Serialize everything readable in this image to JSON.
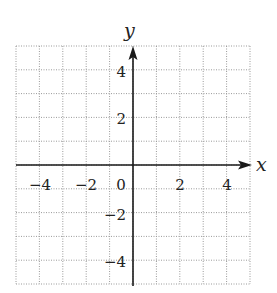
{
  "chart_data": {
    "type": "scatter",
    "title": "",
    "xlabel": "x",
    "ylabel": "y",
    "xlim": [
      -5,
      5
    ],
    "ylim": [
      -5,
      5
    ],
    "grid": true,
    "grid_style": "dotted",
    "grid_step": 1,
    "x_ticks": [
      {
        "value": -4,
        "label": "−4"
      },
      {
        "value": -2,
        "label": "−2"
      },
      {
        "value": 0,
        "label": "0"
      },
      {
        "value": 2,
        "label": "2"
      },
      {
        "value": 4,
        "label": "4"
      }
    ],
    "y_ticks": [
      {
        "value": 4,
        "label": "4"
      },
      {
        "value": 2,
        "label": "2"
      },
      {
        "value": -2,
        "label": "−2"
      },
      {
        "value": -4,
        "label": "−4"
      }
    ],
    "series": [],
    "legend": null,
    "axis_arrows": {
      "x_positive": true,
      "y_positive": true
    }
  },
  "labels": {
    "x_axis": "x",
    "y_axis": "y",
    "x_ticks": [
      "−4",
      "−2",
      "0",
      "2",
      "4"
    ],
    "y_ticks": [
      "4",
      "2",
      "−2",
      "−4"
    ]
  },
  "colors": {
    "axis": "#1a1a1a",
    "grid": "#9a9a9a",
    "text": "#222222",
    "background": "#ffffff"
  }
}
